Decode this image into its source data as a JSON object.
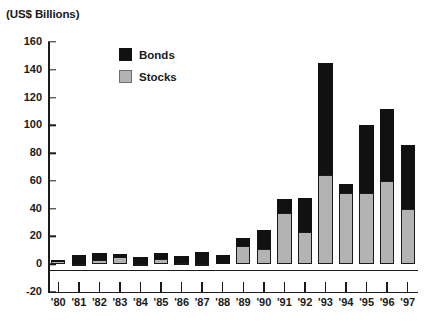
{
  "chart_data": {
    "type": "bar",
    "subtype": "stacked-vertical",
    "title": "(US$ Billions)",
    "xlabel": "",
    "ylabel": "(US$ Billions)",
    "ylim": [
      -20,
      160
    ],
    "ytick_values": [
      160,
      140,
      120,
      100,
      80,
      60,
      40,
      20,
      0,
      -20
    ],
    "ytick_labels": [
      "160",
      "140",
      "120",
      "100",
      "80",
      "60",
      "40",
      "20",
      "0",
      "-20"
    ],
    "ytick_step": 20,
    "grid": false,
    "legend_position": "inside-upper-left",
    "categories": [
      "'80",
      "'81",
      "'82",
      "'83",
      "'84",
      "'85",
      "'86",
      "'87",
      "'88",
      "'89",
      "'90",
      "'91",
      "'92",
      "'93",
      "'94",
      "'95",
      "'96",
      "'97"
    ],
    "series": [
      {
        "name": "Stocks",
        "color": "#b3b3b3",
        "values": [
          2.5,
          0.5,
          3,
          5,
          0.5,
          4,
          1,
          0.5,
          0,
          13,
          11,
          37,
          23,
          64,
          51,
          51,
          60,
          40
        ]
      },
      {
        "name": "Bonds",
        "color": "#111111",
        "values": [
          0.5,
          6,
          5,
          2.5,
          5,
          4,
          5,
          8,
          7,
          6,
          14,
          10,
          25,
          81,
          7,
          49,
          52,
          46
        ]
      }
    ],
    "totals": [
      3,
      6.5,
      8,
      7.5,
      5.5,
      8,
      6,
      8.5,
      7,
      19,
      25,
      47,
      48,
      145,
      58,
      100,
      112,
      86
    ]
  },
  "legend": {
    "items": [
      {
        "label": "Bonds",
        "color": "#111111",
        "swatch": "bonds-swatch"
      },
      {
        "label": "Stocks",
        "color": "#b3b3b3",
        "swatch": "stocks-swatch"
      }
    ]
  }
}
